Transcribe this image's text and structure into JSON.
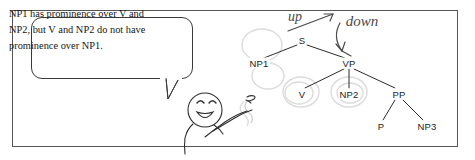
{
  "figure": {
    "frame": {
      "label": "figure-border"
    },
    "speech_bubble": {
      "line1": "NP1 has prominence over V and",
      "line2": "NP2, but V and NP2 do not have",
      "line3": "prominence over NP1.",
      "full_text": "NP1 has prominence over V and NP2, but V and NP2 do not have prominence over NP1."
    },
    "character": {
      "name": "smiling-stick-figure",
      "gesture": "pointing-right",
      "expression": "smiling"
    },
    "tree": {
      "title": "syntax-tree",
      "nodes": [
        {
          "id": "S",
          "label": "S",
          "x": 302,
          "y": 40
        },
        {
          "id": "NP1",
          "label": "NP1",
          "x": 259,
          "y": 63
        },
        {
          "id": "VP",
          "label": "VP",
          "x": 349,
          "y": 63
        },
        {
          "id": "V",
          "label": "V",
          "x": 302,
          "y": 94
        },
        {
          "id": "NP2",
          "label": "NP2",
          "x": 349,
          "y": 94
        },
        {
          "id": "PP",
          "label": "PP",
          "x": 399,
          "y": 94
        },
        {
          "id": "P",
          "label": "P",
          "x": 381,
          "y": 126
        },
        {
          "id": "NP3",
          "label": "NP3",
          "x": 427,
          "y": 126
        }
      ],
      "edges": [
        {
          "from": "S",
          "to": "NP1"
        },
        {
          "from": "S",
          "to": "VP"
        },
        {
          "from": "VP",
          "to": "V"
        },
        {
          "from": "VP",
          "to": "NP2"
        },
        {
          "from": "VP",
          "to": "PP"
        },
        {
          "from": "PP",
          "to": "P"
        },
        {
          "from": "PP",
          "to": "NP3"
        }
      ],
      "circled_nodes": [
        "V",
        "NP2"
      ]
    },
    "annotations": [
      {
        "id": "up",
        "text": "up",
        "x": 295,
        "y": 17,
        "arrow": "up-right"
      },
      {
        "id": "down",
        "text": "down",
        "x": 360,
        "y": 21,
        "arrow": "curved-down-to-VP"
      }
    ],
    "colors": {
      "ink": "#1d1d1d",
      "frame": "#555555",
      "bubble_border": "#3a3a3a",
      "pencil": "#5a5a5a",
      "erased_pencil": "#d8d8d8",
      "background": "#ffffff"
    }
  }
}
